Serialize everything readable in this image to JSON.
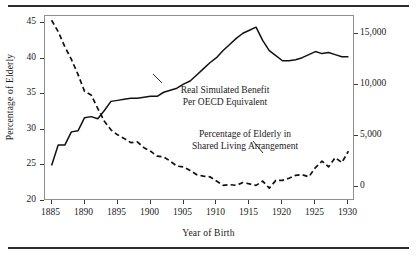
{
  "figure": {
    "top_rule": "horizontal-rule",
    "bottom_rule": "horizontal-rule"
  },
  "chart_data": {
    "type": "line",
    "title": "",
    "subtitle": "",
    "xlabel": "Year of Birth",
    "ylabel": "Percentage of Elderly",
    "ylabel_right": "Simulated Benefit (2001 Dollars)",
    "grid": false,
    "legend": "annotations-inline",
    "xlim": [
      1884,
      1931
    ],
    "xticks": [
      1885,
      1890,
      1895,
      1900,
      1905,
      1910,
      1915,
      1920,
      1925,
      1930
    ],
    "xtick_labels": [
      "1885",
      "1890",
      "1895",
      "1900",
      "1905",
      "1910",
      "1915",
      "1920",
      "1925",
      "1930"
    ],
    "ylim_left": [
      20,
      46
    ],
    "yticks_left": [
      20,
      25,
      30,
      35,
      40,
      45
    ],
    "ytick_labels_left": [
      "20",
      "25",
      "30",
      "35",
      "40",
      "45"
    ],
    "ylim_right": [
      -1400,
      16800
    ],
    "yticks_right": [
      0,
      5000,
      10000,
      15000
    ],
    "ytick_labels_right": [
      "0",
      "5,000",
      "10,000",
      "15,000"
    ],
    "annotations": [
      {
        "name": "real-simulated-benefit",
        "line1": "Real Simulated Benefit",
        "line2": "Per OECD Equivalent"
      },
      {
        "name": "percentage-shared-living",
        "line1": "Percentage of Elderly in",
        "line2": "Shared Living Arrangement"
      }
    ],
    "series": [
      {
        "name": "Real Simulated Benefit Per OECD Equivalent",
        "axis": "right",
        "style": "solid",
        "color": "#111111",
        "units": "2001 Dollars",
        "x": [
          1885,
          1886,
          1887,
          1888,
          1889,
          1890,
          1891,
          1892,
          1893,
          1894,
          1895,
          1896,
          1897,
          1898,
          1899,
          1900,
          1901,
          1902,
          1903,
          1904,
          1905,
          1906,
          1907,
          1908,
          1909,
          1910,
          1911,
          1912,
          1913,
          1914,
          1915,
          1916,
          1917,
          1918,
          1919,
          1920,
          1921,
          1922,
          1923,
          1924,
          1925,
          1926,
          1927,
          1928,
          1929,
          1930
        ],
        "values_left_scale": [
          25.9,
          28.7,
          28.7,
          30.5,
          30.6,
          32.4,
          32.6,
          32.3,
          33.4,
          34.7,
          34.8,
          34.9,
          35.0,
          35.1,
          35.2,
          35.4,
          35.4,
          35.9,
          36.2,
          36.5,
          37.0,
          37.4,
          38.3,
          39.1,
          39.9,
          40.7,
          41.6,
          42.5,
          43.3,
          44.0,
          44.4,
          44.9,
          43.0,
          41.7,
          41.0,
          40.3,
          40.3,
          40.4,
          40.7,
          41.1,
          41.5,
          41.2,
          41.3,
          41.1,
          40.8,
          40.8
        ],
        "values": [
          2100,
          4100,
          4100,
          5400,
          5500,
          6800,
          6900,
          6700,
          7500,
          8400,
          8500,
          8600,
          8700,
          8700,
          8800,
          8900,
          8900,
          9300,
          9500,
          9700,
          10100,
          10400,
          11000,
          11600,
          12200,
          12700,
          13400,
          14000,
          14600,
          15100,
          15400,
          15700,
          14400,
          13400,
          12900,
          12400,
          12400,
          12500,
          12700,
          13000,
          13300,
          13100,
          13200,
          13000,
          12800,
          12800
        ]
      },
      {
        "name": "Percentage of Elderly in Shared Living Arrangement",
        "axis": "left",
        "style": "dashed",
        "color": "#111111",
        "units": "percent",
        "x": [
          1885,
          1886,
          1887,
          1888,
          1889,
          1890,
          1891,
          1892,
          1893,
          1894,
          1895,
          1896,
          1897,
          1898,
          1899,
          1900,
          1901,
          1902,
          1903,
          1904,
          1905,
          1906,
          1907,
          1908,
          1909,
          1910,
          1911,
          1912,
          1913,
          1914,
          1915,
          1916,
          1917,
          1918,
          1919,
          1920,
          1921,
          1922,
          1923,
          1924,
          1925,
          1926,
          1927,
          1928,
          1929,
          1930
        ],
        "values": [
          45.4,
          43.8,
          41.7,
          39.9,
          37.8,
          35.4,
          34.9,
          33.0,
          31.2,
          30.0,
          29.3,
          28.8,
          28.2,
          28.3,
          27.5,
          27.0,
          26.3,
          26.2,
          25.6,
          24.9,
          24.8,
          24.3,
          23.7,
          23.5,
          23.4,
          22.8,
          22.2,
          22.3,
          22.2,
          22.6,
          22.4,
          22.2,
          22.8,
          21.8,
          22.9,
          22.9,
          23.2,
          23.6,
          23.7,
          23.4,
          24.7,
          25.6,
          24.8,
          26.1,
          25.4,
          27.0
        ]
      }
    ]
  }
}
